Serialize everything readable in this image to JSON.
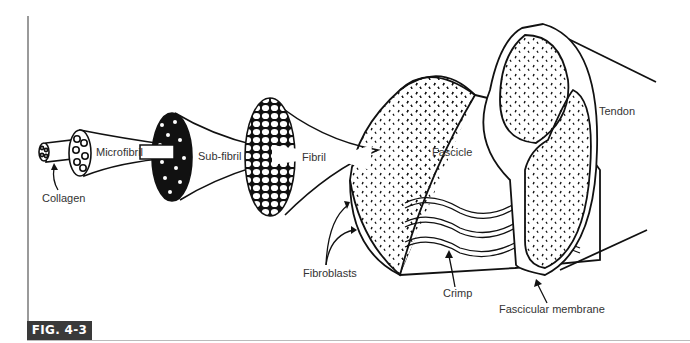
{
  "figure": {
    "label": "FIG. 4-3",
    "badge_color": "#3a3a3a"
  },
  "labels": {
    "collagen": "Collagen",
    "microfibril": "Microfibril",
    "sub_fibril": "Sub-fibril",
    "fibril": "Fibril",
    "fascicle": "Fascicle",
    "fibroblasts": "Fibroblasts",
    "crimp": "Crimp",
    "tendon": "Tendon",
    "fascicular_membrane": "Fascicular membrane"
  }
}
